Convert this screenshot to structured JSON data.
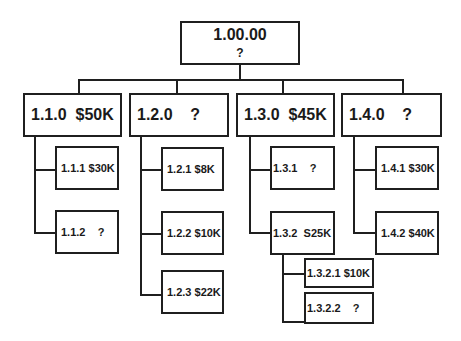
{
  "diagram": {
    "type": "work-breakdown-structure",
    "root": {
      "id": "1.00.00",
      "value": "?"
    },
    "level1": [
      {
        "label": "1.1.0  $50K",
        "id": "1.1.0",
        "value": "$50K"
      },
      {
        "label": "1.2.0    ?",
        "id": "1.2.0",
        "value": "?"
      },
      {
        "label": "1.3.0  $45K",
        "id": "1.3.0",
        "value": "$45K"
      },
      {
        "label": "1.4.0    ?",
        "id": "1.4.0",
        "value": "?"
      }
    ],
    "level2": [
      {
        "label": "1.1.1 $30K",
        "id": "1.1.1",
        "value": "$30K",
        "parent": "1.1.0"
      },
      {
        "label": "1.1.2    ?",
        "id": "1.1.2",
        "value": "?",
        "parent": "1.1.0"
      },
      {
        "label": "1.2.1 $8K",
        "id": "1.2.1",
        "value": "$8K",
        "parent": "1.2.0"
      },
      {
        "label": "1.2.2 $10K",
        "id": "1.2.2",
        "value": "$10K",
        "parent": "1.2.0"
      },
      {
        "label": "1.2.3 $22K",
        "id": "1.2.3",
        "value": "$22K",
        "parent": "1.2.0"
      },
      {
        "label": "1.3.1    ?",
        "id": "1.3.1",
        "value": "?",
        "parent": "1.3.0"
      },
      {
        "label": "1.3.2  S25K",
        "id": "1.3.2",
        "value": "S25K",
        "parent": "1.3.0"
      },
      {
        "label": "1.4.1 $30K",
        "id": "1.4.1",
        "value": "$30K",
        "parent": "1.4.0"
      },
      {
        "label": "1.4.2 $40K",
        "id": "1.4.2",
        "value": "$40K",
        "parent": "1.4.0"
      }
    ],
    "level3": [
      {
        "label": "1.3.2.1 $10K",
        "id": "1.3.2.1",
        "value": "$10K",
        "parent": "1.3.2"
      },
      {
        "label": "1.3.2.2    ?",
        "id": "1.3.2.2",
        "value": "?",
        "parent": "1.3.2"
      }
    ]
  }
}
